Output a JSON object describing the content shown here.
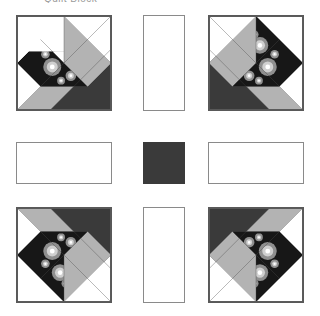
{
  "page": {
    "width": 320,
    "height": 316,
    "background": "#ffffff",
    "header_sliver_text": "Quilt Block"
  },
  "palette": {
    "white": "#ffffff",
    "light_gray": "#b3b3b3",
    "mid_gray": "#8a8a8a",
    "dark_charcoal": "#3a3a3a",
    "floral_ground": "#171717",
    "floral_petal_light": "#d8d8d8",
    "floral_petal_mid": "#9a9a9a",
    "outline": "#595959"
  },
  "layout": {
    "description": "Three-by-three quilt setting: four pieced star blocks at the corners, plain white sashing rectangles between them, and one dark solid square at the center.",
    "grid_rows": 3,
    "grid_cols": 3,
    "block_size_px": 96,
    "sash_short_px": 42
  },
  "blocks": [
    {
      "id": "block-top-left",
      "name": "Pieced star block, original orientation",
      "orientation": "original",
      "x": 16,
      "y": 15
    },
    {
      "id": "block-top-right",
      "name": "Pieced star block, mirrored horizontally",
      "orientation": "mirrored-horizontal",
      "x": 208,
      "y": 15
    },
    {
      "id": "block-bottom-left",
      "name": "Pieced star block, mirrored vertically",
      "orientation": "mirrored-vertical",
      "x": 16,
      "y": 207
    },
    {
      "id": "block-bottom-right",
      "name": "Pieced star block, rotated 180 degrees",
      "orientation": "rotated-180",
      "x": 208,
      "y": 207
    }
  ],
  "sashing": [
    {
      "id": "sash-top",
      "name": "Vertical sashing strip, top",
      "fill": "#ffffff",
      "x": 143,
      "y": 15,
      "w": 42,
      "h": 96
    },
    {
      "id": "sash-left",
      "name": "Horizontal sashing strip, left",
      "fill": "#ffffff",
      "x": 16,
      "y": 142,
      "w": 96,
      "h": 42
    },
    {
      "id": "sash-right",
      "name": "Horizontal sashing strip, right",
      "fill": "#ffffff",
      "x": 208,
      "y": 142,
      "w": 96,
      "h": 42
    },
    {
      "id": "sash-bottom",
      "name": "Vertical sashing strip, bottom",
      "fill": "#ffffff",
      "x": 143,
      "y": 207,
      "w": 42,
      "h": 96
    }
  ],
  "center": {
    "id": "center-square",
    "name": "Center solid square",
    "fill": "#3a3a3a",
    "x": 143,
    "y": 142,
    "w": 42,
    "h": 42
  },
  "block_pieces": {
    "white_corner_square": "White square, upper-left quadrant",
    "white_triangle_lower": "White triangle, lower-left",
    "white_triangle_upper": "White triangle, upper-right",
    "light_gray_band": "Light gray band across the lower-right diagonal",
    "light_gray_wedge": "Light gray wedge at the right edge",
    "dark_corner_triangle": "Dark charcoal triangle at the lower-right corner",
    "floral_star_points": "Dark floral print star points around the center"
  },
  "floral_flowers": [
    {
      "cx": 44,
      "cy": 30,
      "r": 5.0
    },
    {
      "cx": 62,
      "cy": 44,
      "r": 3.2
    },
    {
      "cx": 36,
      "cy": 52,
      "r": 5.4
    },
    {
      "cx": 55,
      "cy": 60,
      "r": 3.0
    },
    {
      "cx": 50,
      "cy": 20,
      "r": 2.6
    },
    {
      "cx": 30,
      "cy": 40,
      "r": 2.4
    },
    {
      "cx": 64,
      "cy": 28,
      "r": 2.2
    },
    {
      "cx": 44,
      "cy": 63,
      "r": 2.2
    }
  ]
}
